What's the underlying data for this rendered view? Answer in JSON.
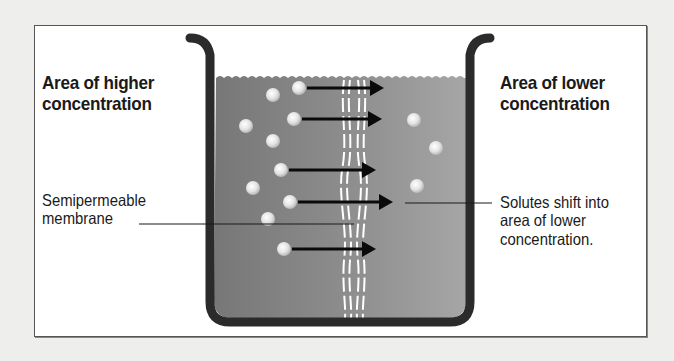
{
  "diagram": {
    "left_heading": {
      "line1": "Area of higher",
      "line2": "concentration"
    },
    "right_heading": {
      "line1": "Area of lower",
      "line2": "concentration"
    },
    "membrane_label": {
      "line1": "Semipermeable",
      "line2": "membrane"
    },
    "solutes_label": {
      "line1": "Solutes shift into",
      "line2": "area of lower",
      "line3": "concentration."
    },
    "colors": {
      "background": "#eeeeec",
      "panel": "#ffffff",
      "beaker": "#2b2b2b",
      "solution_left": "#7d7d7d",
      "solution_right": "#a0a0a0",
      "particle": "#e6e6e6",
      "arrow": "#0a0a0a",
      "membrane": "#ffffff"
    },
    "left_particle_count": 10,
    "right_particle_count": 3,
    "arrow_count": 5
  }
}
